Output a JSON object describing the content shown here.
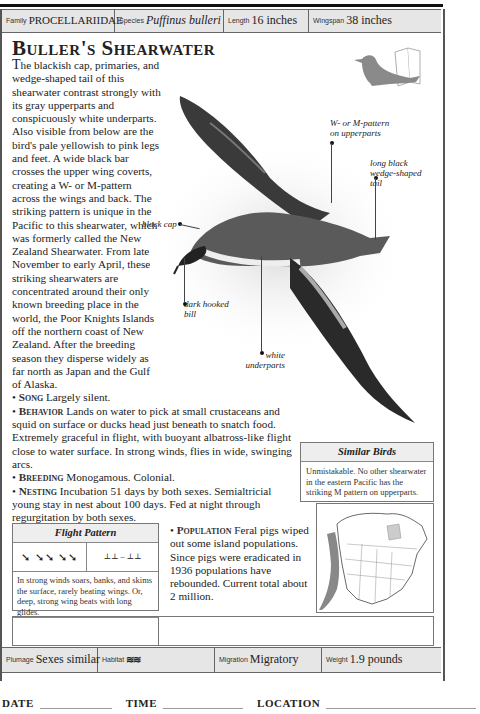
{
  "header": {
    "family_label": "Family",
    "family_value": "PROCELLARIIDAE",
    "species_label": "Species",
    "species_value": "Puffinus bulleri",
    "length_label": "Length",
    "length_value": "16 inches",
    "wingspan_label": "Wingspan",
    "wingspan_value": "38 inches"
  },
  "title": "Buller's Shearwater",
  "description": {
    "intro_cap": "T",
    "intro": "he blackish cap, primaries, and wedge-shaped tail of this shearwater contrast strongly with its gray upperparts and conspicuously white underparts. Also visible from below are the bird's pale yellowish to pink legs and feet. A wide black bar crosses the upper wing coverts, creating a W- or M-pattern across the wings and back. The striking pattern is unique in the Pacific to this shearwater, which was formerly called the New Zealand Shearwater. From late November to early April, these striking shearwaters are concentrated around their only known breeding place in the world, the Poor Knights Islands off the northern coast of New Zealand.  After the breeding season they disperse widely as far north as Japan and the Gulf of Alaska.",
    "song_label": "Song",
    "song_text": "Largely silent.",
    "behavior_label": "Behavior",
    "behavior_text": "Lands on water to pick at small crustaceans and squid on surface or ducks head just beneath to snatch food. Extremely graceful in flight, with buoyant albatross-like flight close to water surface. In strong winds, flies in wide, swinging arcs.",
    "breeding_label": "Breeding",
    "breeding_text": "Monogamous. Colonial.",
    "nesting_label": "Nesting",
    "nesting_text": "Incubation 51 days by both sexes. Semialtricial young stay in nest about 100 days. Fed at night through regurgitation by both sexes.",
    "population_label": "Population",
    "population_text": "Feral pigs wiped out some island populations. Since pigs were eradicated in 1936 populations have rebounded. Current total about 2 million."
  },
  "callouts": {
    "upperparts": "W- or M-pattern on upperparts",
    "tail": "long black wedge-shaped tail",
    "cap": "black cap",
    "bill": "dark hooked bill",
    "underparts": "white underparts"
  },
  "similar_birds": {
    "title": "Similar Birds",
    "text": "Unmistakable. No other shearwater in the eastern Pacific has the striking M pattern on upperparts."
  },
  "flight_pattern": {
    "title": "Flight Pattern",
    "text": "In strong winds soars, banks, and skims the surface, rarely beating wings. Or, deep, strong wing beats with long glides."
  },
  "nest_identification": {
    "title": "Nest Identification",
    "shape_label": "Shape",
    "location_label": "Location",
    "text": "Leaves, twigs, and pebbles • on ground • up to 10 feet long • built by both sexes • 1 white egg."
  },
  "footer": {
    "plumage_label": "Plumage",
    "plumage_value": "Sexes similar",
    "habitat_label": "Habitat",
    "migration_label": "Migration",
    "migration_value": "Migratory",
    "weight_label": "Weight",
    "weight_value": "1.9 pounds"
  },
  "log": {
    "date": "DATE",
    "time": "TIME",
    "location": "LOCATION"
  },
  "colors": {
    "header_bg": "#e6e6e6",
    "range_gray": "#888888",
    "icon_gray": "#8a8a8a"
  }
}
